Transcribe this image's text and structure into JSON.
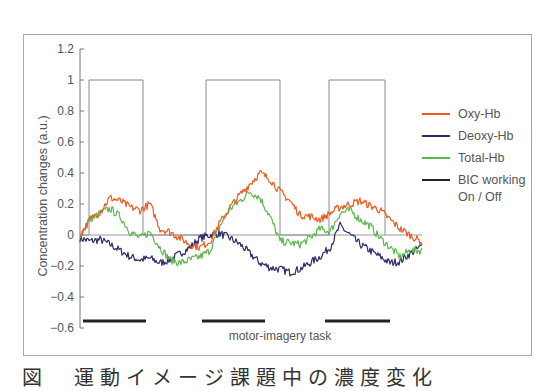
{
  "chart_data": {
    "type": "line",
    "title": "",
    "xlabel": "motor-imagery task",
    "ylabel": "Concentration changes (a.u.)",
    "ylim": [
      -0.6,
      1.2
    ],
    "yticks": [
      "1.2",
      "1",
      "0.8",
      "0.6",
      "0.4",
      "0.2",
      "0",
      "−0.2",
      "−0.4",
      "−0.6"
    ],
    "ytick_values": [
      1.2,
      1.0,
      0.8,
      0.6,
      0.4,
      0.2,
      0,
      -0.2,
      -0.4,
      -0.6
    ],
    "grid": false,
    "zero_line": true,
    "legend_position": "right",
    "x": [
      0,
      10,
      20,
      30,
      40,
      50,
      60,
      70,
      80,
      90,
      100,
      110,
      120,
      130,
      140,
      150,
      160,
      170,
      180,
      190,
      200,
      210,
      220,
      230,
      240,
      250,
      260,
      270,
      280,
      290,
      300,
      310,
      320,
      330,
      340
    ],
    "series": [
      {
        "name": "Oxy-Hb",
        "color": "#f05a1e",
        "values": [
          0.0,
          0.1,
          0.15,
          0.24,
          0.22,
          0.18,
          0.16,
          0.2,
          0.04,
          0.02,
          -0.02,
          -0.06,
          -0.08,
          -0.04,
          0.08,
          0.18,
          0.26,
          0.33,
          0.4,
          0.36,
          0.28,
          0.22,
          0.13,
          0.12,
          0.1,
          0.14,
          0.18,
          0.2,
          0.22,
          0.19,
          0.16,
          0.1,
          0.04,
          0.0,
          -0.04
        ]
      },
      {
        "name": "Deoxy-Hb",
        "color": "#2e2a6e",
        "values": [
          -0.02,
          -0.04,
          -0.03,
          -0.06,
          -0.1,
          -0.14,
          -0.16,
          -0.15,
          -0.18,
          -0.16,
          -0.12,
          -0.08,
          -0.02,
          0.0,
          0.01,
          -0.02,
          -0.06,
          -0.12,
          -0.18,
          -0.21,
          -0.22,
          -0.24,
          -0.22,
          -0.18,
          -0.14,
          -0.08,
          0.06,
          0.0,
          -0.06,
          -0.1,
          -0.14,
          -0.18,
          -0.17,
          -0.12,
          -0.08
        ]
      },
      {
        "name": "Total-Hb",
        "color": "#5cb84a",
        "values": [
          0.0,
          0.1,
          0.14,
          0.17,
          0.12,
          0.02,
          -0.02,
          0.02,
          -0.08,
          -0.16,
          -0.18,
          -0.16,
          -0.14,
          -0.1,
          0.06,
          0.17,
          0.22,
          0.28,
          0.24,
          0.12,
          -0.04,
          -0.05,
          -0.06,
          -0.02,
          0.04,
          0.02,
          0.14,
          0.16,
          0.1,
          0.06,
          -0.02,
          -0.08,
          -0.14,
          -0.1,
          -0.1
        ]
      },
      {
        "name": "BIC working On / Off",
        "color": "#222222",
        "type": "step",
        "on_intervals_px": [
          [
            89,
            143
          ],
          [
            206,
            280
          ],
          [
            329,
            385
          ]
        ],
        "on_value": 1.0,
        "off_value": 0.0
      }
    ],
    "task_bars_px": [
      [
        83,
        146
      ],
      [
        202,
        265
      ],
      [
        325,
        390
      ]
    ],
    "legend": [
      {
        "label": "Oxy-Hb",
        "color": "#f05a1e"
      },
      {
        "label": "Deoxy-Hb",
        "color": "#2e2a6e"
      },
      {
        "label": "Total-Hb",
        "color": "#5cb84a"
      },
      {
        "label": "BIC working",
        "label2": "On / Off",
        "color": "#222222"
      }
    ]
  },
  "caption": "図 運動イメージ課題中の濃度変化"
}
